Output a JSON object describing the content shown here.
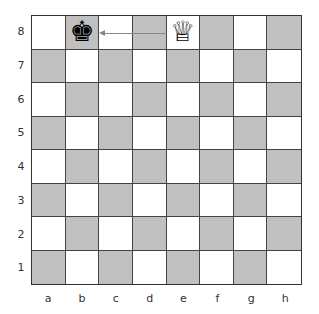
{
  "board": {
    "files": [
      "a",
      "b",
      "c",
      "d",
      "e",
      "f",
      "g",
      "h"
    ],
    "ranks": [
      "8",
      "7",
      "6",
      "5",
      "4",
      "3",
      "2",
      "1"
    ],
    "colors": {
      "light": "#ffffff",
      "dark": "#c0c0c0"
    },
    "pieces": [
      {
        "square": "b8",
        "piece": "black-king",
        "glyph": "♚"
      },
      {
        "square": "e8",
        "piece": "white-queen",
        "glyph": "♕"
      }
    ],
    "arrow": {
      "from": "e8",
      "to": "c8",
      "color": "#888888"
    }
  }
}
